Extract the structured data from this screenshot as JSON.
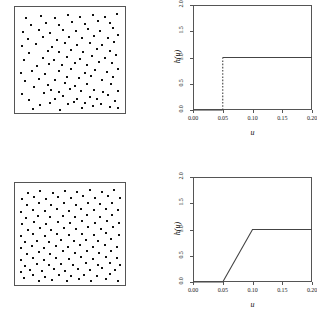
{
  "figure": {
    "panels": [
      {
        "id": "top-left",
        "kind": "point-pattern"
      },
      {
        "id": "top-right",
        "kind": "function-plot"
      },
      {
        "id": "bottom-left",
        "kind": "point-pattern"
      },
      {
        "id": "bottom-right",
        "kind": "function-plot"
      }
    ]
  },
  "chart_data": [
    {
      "id": "top-left-pattern",
      "type": "scatter",
      "title": "",
      "xlabel": "",
      "ylabel": "",
      "xlim": [
        0,
        1
      ],
      "ylim": [
        0,
        1
      ],
      "grid": false,
      "legend": "none",
      "marker": "filled-square",
      "n_points": 104,
      "points": [
        [
          0.145,
          0.01
        ],
        [
          0.405,
          0.005
        ],
        [
          0.612,
          0.02
        ],
        [
          0.722,
          0.04
        ],
        [
          0.885,
          0.03
        ],
        [
          0.96,
          0.02
        ],
        [
          0.215,
          0.055
        ],
        [
          0.305,
          0.075
        ],
        [
          0.48,
          0.06
        ],
        [
          0.54,
          0.085
        ],
        [
          0.648,
          0.072
        ],
        [
          0.8,
          0.062
        ],
        [
          0.93,
          0.09
        ],
        [
          0.105,
          0.105
        ],
        [
          0.352,
          0.115
        ],
        [
          0.43,
          0.14
        ],
        [
          0.572,
          0.11
        ],
        [
          0.69,
          0.135
        ],
        [
          0.762,
          0.108
        ],
        [
          0.862,
          0.15
        ],
        [
          0.042,
          0.16
        ],
        [
          0.25,
          0.168
        ],
        [
          0.318,
          0.2
        ],
        [
          0.398,
          0.185
        ],
        [
          0.5,
          0.215
        ],
        [
          0.61,
          0.19
        ],
        [
          0.728,
          0.205
        ],
        [
          0.82,
          0.178
        ],
        [
          0.96,
          0.195
        ],
        [
          0.15,
          0.235
        ],
        [
          0.288,
          0.252
        ],
        [
          0.455,
          0.268
        ],
        [
          0.548,
          0.24
        ],
        [
          0.66,
          0.262
        ],
        [
          0.89,
          0.258
        ],
        [
          0.068,
          0.295
        ],
        [
          0.205,
          0.31
        ],
        [
          0.36,
          0.3
        ],
        [
          0.47,
          0.33
        ],
        [
          0.585,
          0.318
        ],
        [
          0.705,
          0.342
        ],
        [
          0.808,
          0.305
        ],
        [
          0.912,
          0.335
        ],
        [
          0.03,
          0.37
        ],
        [
          0.13,
          0.395
        ],
        [
          0.262,
          0.362
        ],
        [
          0.398,
          0.388
        ],
        [
          0.512,
          0.408
        ],
        [
          0.64,
          0.372
        ],
        [
          0.742,
          0.398
        ],
        [
          0.858,
          0.385
        ],
        [
          0.958,
          0.412
        ],
        [
          0.182,
          0.44
        ],
        [
          0.3,
          0.462
        ],
        [
          0.425,
          0.448
        ],
        [
          0.552,
          0.475
        ],
        [
          0.668,
          0.452
        ],
        [
          0.782,
          0.48
        ],
        [
          0.905,
          0.468
        ],
        [
          0.055,
          0.5
        ],
        [
          0.24,
          0.518
        ],
        [
          0.348,
          0.505
        ],
        [
          0.468,
          0.535
        ],
        [
          0.598,
          0.512
        ],
        [
          0.715,
          0.54
        ],
        [
          0.838,
          0.525
        ],
        [
          0.945,
          0.552
        ],
        [
          0.108,
          0.572
        ],
        [
          0.285,
          0.59
        ],
        [
          0.398,
          0.578
        ],
        [
          0.512,
          0.605
        ],
        [
          0.625,
          0.585
        ],
        [
          0.76,
          0.612
        ],
        [
          0.88,
          0.595
        ],
        [
          0.035,
          0.64
        ],
        [
          0.175,
          0.658
        ],
        [
          0.33,
          0.635
        ],
        [
          0.452,
          0.668
        ],
        [
          0.572,
          0.648
        ],
        [
          0.69,
          0.672
        ],
        [
          0.805,
          0.655
        ],
        [
          0.925,
          0.682
        ],
        [
          0.095,
          0.712
        ],
        [
          0.238,
          0.728
        ],
        [
          0.372,
          0.705
        ],
        [
          0.488,
          0.735
        ],
        [
          0.612,
          0.718
        ],
        [
          0.732,
          0.742
        ],
        [
          0.862,
          0.725
        ],
        [
          0.962,
          0.748
        ],
        [
          0.048,
          0.782
        ],
        [
          0.198,
          0.798
        ],
        [
          0.308,
          0.775
        ],
        [
          0.43,
          0.805
        ],
        [
          0.558,
          0.788
        ],
        [
          0.672,
          0.812
        ],
        [
          0.79,
          0.795
        ],
        [
          0.912,
          0.818
        ],
        [
          0.128,
          0.855
        ],
        [
          0.268,
          0.872
        ],
        [
          0.392,
          0.848
        ],
        [
          0.52,
          0.88
        ],
        [
          0.645,
          0.862
        ],
        [
          0.768,
          0.888
        ],
        [
          0.888,
          0.868
        ],
        [
          0.075,
          0.925
        ],
        [
          0.222,
          0.945
        ],
        [
          0.355,
          0.918
        ],
        [
          0.478,
          0.948
        ],
        [
          0.6,
          0.93
        ],
        [
          0.718,
          0.955
        ],
        [
          0.84,
          0.935
        ],
        [
          0.955,
          0.962
        ]
      ]
    },
    {
      "id": "top-right-h",
      "type": "line",
      "title": "",
      "xlabel": "u",
      "ylabel": "h(u)",
      "xlim": [
        0.0,
        0.2
      ],
      "ylim": [
        0.0,
        2.0
      ],
      "xticks": [
        0.0,
        0.05,
        0.1,
        0.15,
        0.2
      ],
      "xticklabels": [
        "0.00",
        "0.05",
        "0.10",
        "0.15",
        "0.20"
      ],
      "yticks": [
        0.0,
        0.5,
        1.0,
        1.5,
        2.0
      ],
      "yticklabels": [
        "0.0",
        "0.5",
        "1.0",
        "1.5",
        "2.0"
      ],
      "grid": false,
      "legend": "none",
      "function_form": "hard-core step",
      "segments": [
        {
          "style": "solid",
          "points": [
            [
              0.0,
              0.0
            ],
            [
              0.05,
              0.0
            ]
          ]
        },
        {
          "style": "dashed",
          "points": [
            [
              0.05,
              0.0
            ],
            [
              0.05,
              1.0
            ]
          ]
        },
        {
          "style": "solid",
          "points": [
            [
              0.05,
              1.0
            ],
            [
              0.2,
              1.0
            ]
          ]
        }
      ]
    },
    {
      "id": "bottom-left-pattern",
      "type": "scatter",
      "title": "",
      "xlabel": "",
      "ylabel": "",
      "xlim": [
        0,
        1
      ],
      "ylim": [
        0,
        1
      ],
      "grid": false,
      "legend": "none",
      "marker": "filled-square",
      "n_points": 110,
      "points": [
        [
          0.205,
          0.008
        ],
        [
          0.33,
          0.022
        ],
        [
          0.47,
          0.012
        ],
        [
          0.585,
          0.03
        ],
        [
          0.7,
          0.015
        ],
        [
          0.848,
          0.028
        ],
        [
          0.958,
          0.012
        ],
        [
          0.062,
          0.045
        ],
        [
          0.148,
          0.068
        ],
        [
          0.262,
          0.055
        ],
        [
          0.392,
          0.072
        ],
        [
          0.512,
          0.058
        ],
        [
          0.632,
          0.078
        ],
        [
          0.76,
          0.062
        ],
        [
          0.888,
          0.08
        ],
        [
          0.028,
          0.105
        ],
        [
          0.112,
          0.128
        ],
        [
          0.228,
          0.112
        ],
        [
          0.348,
          0.135
        ],
        [
          0.455,
          0.118
        ],
        [
          0.578,
          0.14
        ],
        [
          0.688,
          0.122
        ],
        [
          0.812,
          0.142
        ],
        [
          0.932,
          0.125
        ],
        [
          0.068,
          0.168
        ],
        [
          0.182,
          0.185
        ],
        [
          0.298,
          0.172
        ],
        [
          0.412,
          0.192
        ],
        [
          0.532,
          0.175
        ],
        [
          0.65,
          0.198
        ],
        [
          0.768,
          0.18
        ],
        [
          0.885,
          0.2
        ],
        [
          0.982,
          0.182
        ],
        [
          0.032,
          0.228
        ],
        [
          0.142,
          0.248
        ],
        [
          0.252,
          0.232
        ],
        [
          0.368,
          0.255
        ],
        [
          0.488,
          0.238
        ],
        [
          0.605,
          0.258
        ],
        [
          0.722,
          0.242
        ],
        [
          0.842,
          0.262
        ],
        [
          0.952,
          0.245
        ],
        [
          0.085,
          0.292
        ],
        [
          0.198,
          0.312
        ],
        [
          0.312,
          0.295
        ],
        [
          0.428,
          0.318
        ],
        [
          0.545,
          0.3
        ],
        [
          0.662,
          0.322
        ],
        [
          0.782,
          0.305
        ],
        [
          0.898,
          0.325
        ],
        [
          0.025,
          0.352
        ],
        [
          0.135,
          0.372
        ],
        [
          0.248,
          0.358
        ],
        [
          0.365,
          0.378
        ],
        [
          0.482,
          0.362
        ],
        [
          0.6,
          0.382
        ],
        [
          0.718,
          0.365
        ],
        [
          0.838,
          0.385
        ],
        [
          0.955,
          0.368
        ],
        [
          0.07,
          0.415
        ],
        [
          0.185,
          0.432
        ],
        [
          0.302,
          0.418
        ],
        [
          0.418,
          0.438
        ],
        [
          0.538,
          0.422
        ],
        [
          0.655,
          0.442
        ],
        [
          0.772,
          0.425
        ],
        [
          0.892,
          0.445
        ],
        [
          0.03,
          0.478
        ],
        [
          0.145,
          0.495
        ],
        [
          0.258,
          0.482
        ],
        [
          0.378,
          0.502
        ],
        [
          0.495,
          0.485
        ],
        [
          0.612,
          0.505
        ],
        [
          0.73,
          0.488
        ],
        [
          0.85,
          0.508
        ],
        [
          0.968,
          0.492
        ],
        [
          0.092,
          0.54
        ],
        [
          0.208,
          0.558
        ],
        [
          0.322,
          0.545
        ],
        [
          0.44,
          0.562
        ],
        [
          0.558,
          0.548
        ],
        [
          0.675,
          0.568
        ],
        [
          0.795,
          0.552
        ],
        [
          0.912,
          0.572
        ],
        [
          0.038,
          0.605
        ],
        [
          0.152,
          0.622
        ],
        [
          0.268,
          0.608
        ],
        [
          0.385,
          0.628
        ],
        [
          0.502,
          0.612
        ],
        [
          0.62,
          0.632
        ],
        [
          0.738,
          0.615
        ],
        [
          0.858,
          0.635
        ],
        [
          0.975,
          0.618
        ],
        [
          0.078,
          0.668
        ],
        [
          0.195,
          0.685
        ],
        [
          0.312,
          0.672
        ],
        [
          0.43,
          0.692
        ],
        [
          0.548,
          0.675
        ],
        [
          0.665,
          0.695
        ],
        [
          0.785,
          0.678
        ],
        [
          0.902,
          0.698
        ],
        [
          0.028,
          0.732
        ],
        [
          0.142,
          0.752
        ],
        [
          0.258,
          0.738
        ],
        [
          0.375,
          0.758
        ],
        [
          0.492,
          0.742
        ],
        [
          0.61,
          0.762
        ],
        [
          0.728,
          0.745
        ],
        [
          0.848,
          0.765
        ],
        [
          0.965,
          0.748
        ],
        [
          0.085,
          0.798
        ],
        [
          0.202,
          0.818
        ],
        [
          0.318,
          0.802
        ],
        [
          0.438,
          0.822
        ],
        [
          0.555,
          0.805
        ],
        [
          0.672,
          0.825
        ],
        [
          0.792,
          0.808
        ],
        [
          0.908,
          0.828
        ],
        [
          0.035,
          0.862
        ],
        [
          0.152,
          0.882
        ],
        [
          0.268,
          0.868
        ],
        [
          0.388,
          0.888
        ],
        [
          0.505,
          0.872
        ],
        [
          0.622,
          0.892
        ],
        [
          0.742,
          0.875
        ],
        [
          0.862,
          0.895
        ],
        [
          0.978,
          0.878
        ],
        [
          0.098,
          0.928
        ],
        [
          0.215,
          0.948
        ],
        [
          0.332,
          0.932
        ],
        [
          0.452,
          0.952
        ],
        [
          0.57,
          0.935
        ],
        [
          0.688,
          0.955
        ],
        [
          0.808,
          0.938
        ],
        [
          0.925,
          0.958
        ]
      ]
    },
    {
      "id": "bottom-right-h",
      "type": "line",
      "title": "",
      "xlabel": "u",
      "ylabel": "h(u)",
      "xlim": [
        0.0,
        0.2
      ],
      "ylim": [
        0.0,
        2.0
      ],
      "xticks": [
        0.0,
        0.05,
        0.1,
        0.15,
        0.2
      ],
      "xticklabels": [
        "0.00",
        "0.05",
        "0.10",
        "0.15",
        "0.20"
      ],
      "yticks": [
        0.0,
        0.5,
        1.0,
        1.5,
        2.0
      ],
      "yticklabels": [
        "0.0",
        "0.5",
        "1.0",
        "1.5",
        "2.0"
      ],
      "grid": false,
      "legend": "none",
      "function_form": "piecewise-linear ramp",
      "segments": [
        {
          "style": "solid",
          "points": [
            [
              0.0,
              0.0
            ],
            [
              0.05,
              0.0
            ],
            [
              0.1,
              1.0
            ],
            [
              0.2,
              1.0
            ]
          ]
        }
      ]
    }
  ],
  "style": {
    "line_color": "#444444",
    "frame_color": "#555555",
    "point_color": "#111111",
    "background": "#ffffff"
  }
}
